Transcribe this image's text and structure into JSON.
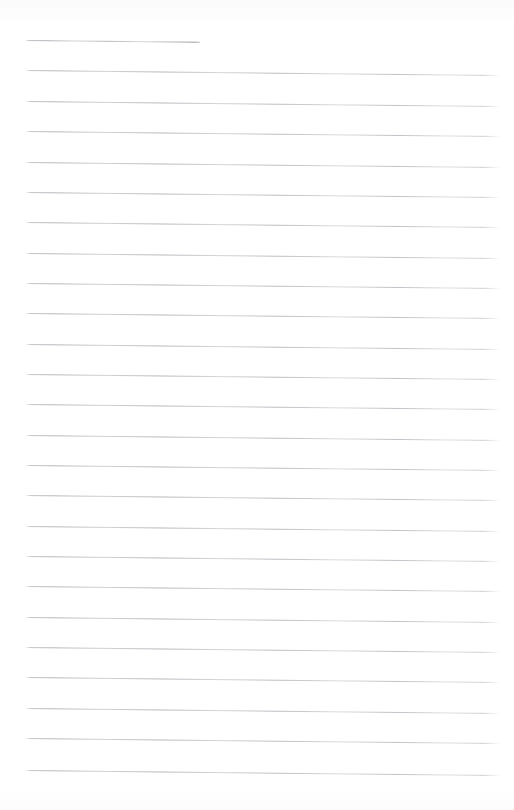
{
  "document": {
    "title": "Lined Paper Sheet",
    "kind": "blank-ruled-notepaper-scan",
    "page_width": 514,
    "page_height": 810,
    "background_color": "#fefefe",
    "rule_color": "#b9bdc1",
    "rule_thickness_px": 1,
    "rule_count": 25,
    "rule_spacing_px": 30.4,
    "first_rule_y": 40,
    "last_rule_y": 770,
    "rule_left_x": 25,
    "rule_right_x": 500,
    "skew_degrees": 0.6,
    "has_vertical_margin_rule": false,
    "has_handwriting": false,
    "has_text": false,
    "body_text": ""
  },
  "rules": [
    {
      "index": 1,
      "y": 40,
      "left": 25,
      "right": 200,
      "short": true
    },
    {
      "index": 2,
      "y": 70,
      "left": 25,
      "right": 500,
      "short": false
    },
    {
      "index": 3,
      "y": 101,
      "left": 25,
      "right": 500,
      "short": false
    },
    {
      "index": 4,
      "y": 131,
      "left": 25,
      "right": 500,
      "short": false
    },
    {
      "index": 5,
      "y": 162,
      "left": 25,
      "right": 500,
      "short": false
    },
    {
      "index": 6,
      "y": 192,
      "left": 25,
      "right": 500,
      "short": false
    },
    {
      "index": 7,
      "y": 222,
      "left": 25,
      "right": 500,
      "short": false
    },
    {
      "index": 8,
      "y": 253,
      "left": 25,
      "right": 500,
      "short": false
    },
    {
      "index": 9,
      "y": 283,
      "left": 25,
      "right": 500,
      "short": false
    },
    {
      "index": 10,
      "y": 313,
      "left": 25,
      "right": 500,
      "short": false
    },
    {
      "index": 11,
      "y": 344,
      "left": 25,
      "right": 500,
      "short": false
    },
    {
      "index": 12,
      "y": 374,
      "left": 25,
      "right": 500,
      "short": false
    },
    {
      "index": 13,
      "y": 404,
      "left": 25,
      "right": 500,
      "short": false
    },
    {
      "index": 14,
      "y": 435,
      "left": 25,
      "right": 500,
      "short": false
    },
    {
      "index": 15,
      "y": 465,
      "left": 25,
      "right": 500,
      "short": false
    },
    {
      "index": 16,
      "y": 495,
      "left": 25,
      "right": 500,
      "short": false
    },
    {
      "index": 17,
      "y": 526,
      "left": 25,
      "right": 500,
      "short": false
    },
    {
      "index": 18,
      "y": 556,
      "left": 25,
      "right": 500,
      "short": false
    },
    {
      "index": 19,
      "y": 586,
      "left": 25,
      "right": 500,
      "short": false
    },
    {
      "index": 20,
      "y": 617,
      "left": 25,
      "right": 500,
      "short": false
    },
    {
      "index": 21,
      "y": 647,
      "left": 25,
      "right": 500,
      "short": false
    },
    {
      "index": 22,
      "y": 677,
      "left": 25,
      "right": 500,
      "short": false
    },
    {
      "index": 23,
      "y": 708,
      "left": 25,
      "right": 500,
      "short": false
    },
    {
      "index": 24,
      "y": 738,
      "left": 25,
      "right": 500,
      "short": false
    },
    {
      "index": 25,
      "y": 770,
      "left": 25,
      "right": 500,
      "short": false
    }
  ]
}
